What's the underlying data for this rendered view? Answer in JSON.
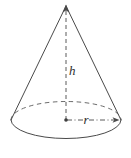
{
  "figure": {
    "kind": "geometry-diagram",
    "shape_name": "cone",
    "canvas": {
      "width": 131,
      "height": 158,
      "background": "#ffffff"
    },
    "colors": {
      "solid_edge": "#4a4a4a",
      "hidden_edge": "#6b6b6b",
      "dimension_line": "#5a5a5a",
      "label_text": "#2e2e2e"
    },
    "labels": {
      "height": "h",
      "radius": "r"
    },
    "geometry": {
      "apex": {
        "x": 66,
        "y": 6
      },
      "base_center": {
        "x": 66,
        "y": 120
      },
      "base_rx": 55,
      "base_ry": 18.5,
      "base_left": {
        "x": 11,
        "y": 120
      },
      "base_right": {
        "x": 121,
        "y": 120
      },
      "height_label_pos": {
        "x": 70,
        "y": 74
      },
      "radius_label_pos": {
        "x": 84,
        "y": 123
      },
      "radius_arrow_tip": {
        "x": 118,
        "y": 120
      },
      "apex_arrow_tip": {
        "x": 66,
        "y": 5
      }
    },
    "strokes": {
      "hidden_arc_dasharray": "4.5 3.5",
      "height_dasharray": "4 3",
      "radius_dasharray": "5 2.5 1 2.5"
    }
  }
}
